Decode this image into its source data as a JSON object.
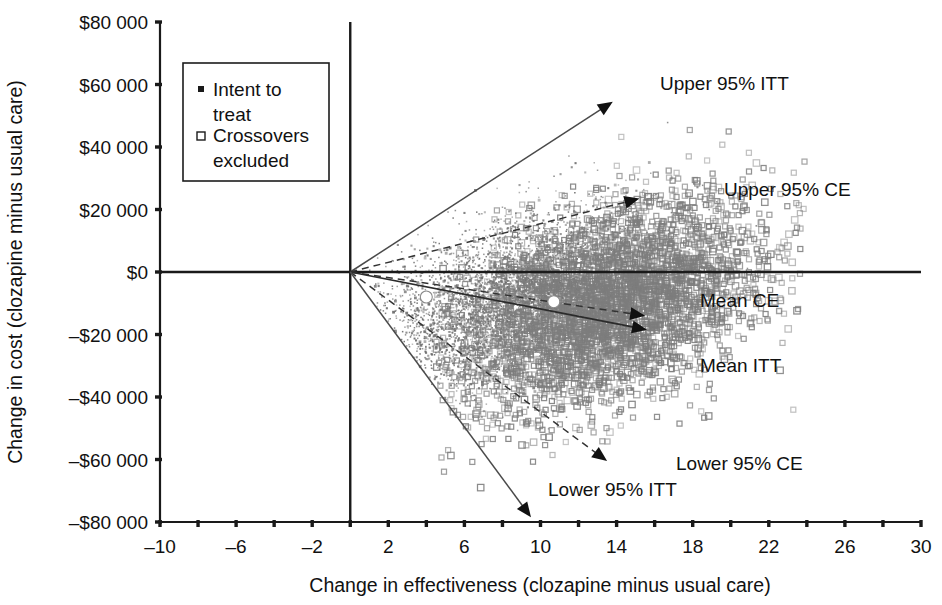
{
  "chart_data": {
    "type": "scatter",
    "title": "",
    "xlabel": "Change in effectiveness (clozapine minus usual care)",
    "ylabel": "Change in cost (clozapine minus usual care)",
    "xlim": [
      -10,
      30
    ],
    "ylim": [
      -80000,
      80000
    ],
    "grid": false,
    "x_ticks": [
      -10,
      -6,
      -2,
      2,
      6,
      10,
      14,
      18,
      22,
      26,
      30
    ],
    "x_tick_labels": [
      "-10",
      "-6",
      "-2",
      "2",
      "6",
      "10",
      "14",
      "18",
      "22",
      "26",
      "30"
    ],
    "x_minor_tick_step": 2,
    "y_ticks": [
      80000,
      60000,
      40000,
      20000,
      0,
      -20000,
      -40000,
      -60000,
      -80000
    ],
    "y_tick_labels": [
      "$80 000",
      "$60 000",
      "$40 000",
      "$20 000",
      "$0",
      "-$20 000",
      "-$40 000",
      "-$60 000",
      "-$80 000"
    ],
    "legend_position": "upper-left",
    "series": [
      {
        "name": "Intent to treat",
        "marker": "filled-square-small",
        "color": "#6e6e6e",
        "n_points": 4200,
        "cloud_center_x": 8.2,
        "cloud_center_y": -9500,
        "cloud_spread_x": 3.6,
        "cloud_spread_y": 15500,
        "mean_x": 4.0,
        "mean_y": -8000
      },
      {
        "name": "Crossovers excluded",
        "marker": "open-square",
        "color": "#7d7d7d",
        "n_points": 3600,
        "cloud_center_x": 13.6,
        "cloud_center_y": -10500,
        "cloud_spread_x": 4.0,
        "cloud_spread_y": 18500,
        "mean_x": 10.7,
        "mean_y": -9500
      }
    ],
    "ray_annotations": [
      {
        "name": "Upper 95% ITT",
        "label": "Upper 95% ITT",
        "style": "solid",
        "from_x": 0,
        "from_y": 0,
        "to_x": 13.8,
        "to_y": 54500
      },
      {
        "name": "Upper 95% CE",
        "label": "Upper 95% CE",
        "style": "dashed",
        "from_x": 0,
        "from_y": 0,
        "to_x": 15.2,
        "to_y": 23500
      },
      {
        "name": "Mean CE",
        "label": "Mean CE",
        "style": "dashed",
        "from_x": 0,
        "from_y": 0,
        "to_x": 15.5,
        "to_y": -14000
      },
      {
        "name": "Mean ITT",
        "label": "Mean ITT",
        "style": "solid",
        "from_x": 0,
        "from_y": 0,
        "to_x": 15.6,
        "to_y": -18500
      },
      {
        "name": "Lower 95% CE",
        "label": "Lower 95% CE",
        "style": "dashed",
        "from_x": 0,
        "from_y": 0,
        "to_x": 13.5,
        "to_y": -60500
      },
      {
        "name": "Lower 95% ITT",
        "label": "Lower 95% ITT",
        "style": "solid",
        "from_x": 0,
        "from_y": 0,
        "to_x": 9.5,
        "to_y": -78500
      }
    ],
    "mean_markers": [
      {
        "name": "mean-itt-point",
        "x": 4.0,
        "y": -8000
      },
      {
        "name": "mean-ce-point",
        "x": 10.7,
        "y": -9500
      }
    ]
  },
  "legend": {
    "items": [
      {
        "marker": "filled-square",
        "label_line1": "Intent to",
        "label_line2": "treat"
      },
      {
        "marker": "open-square",
        "label_line1": "Crossovers",
        "label_line2": "excluded"
      }
    ]
  },
  "colors": {
    "axis": "#1a1a1a",
    "itt_marker": "#6e6e6e",
    "ce_marker": "#7d7d7d",
    "arrow": "#111111",
    "background": "#ffffff"
  }
}
